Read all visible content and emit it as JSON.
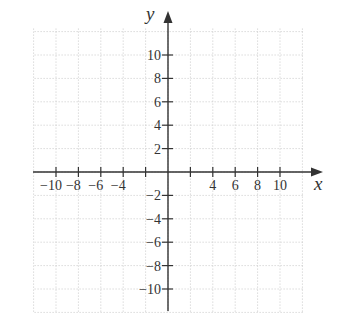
{
  "chart_data": {
    "type": "scatter",
    "title": "",
    "xlabel": "x",
    "ylabel": "y",
    "xlim": [
      -12,
      12
    ],
    "ylim": [
      -12,
      12
    ],
    "grid": true,
    "grid_step": 2,
    "grid_style": "dotted",
    "x_ticks": [
      -10,
      -8,
      -6,
      -4,
      -2,
      2,
      4,
      6,
      8,
      10
    ],
    "x_tick_labels": [
      "−10",
      "−8",
      "−6",
      "−4",
      "",
      "",
      "4",
      "6",
      "8",
      "10"
    ],
    "y_ticks": [
      10,
      8,
      6,
      4,
      2,
      -2,
      -4,
      -6,
      -8,
      -10
    ],
    "y_tick_labels": [
      "10",
      "8",
      "6",
      "4",
      "2",
      "−2",
      "−4",
      "−6",
      "−8",
      "−10"
    ],
    "series": [],
    "legend": null
  },
  "colors": {
    "axis": "#333333",
    "grid": "#c8c8c8",
    "background": "#ffffff"
  }
}
